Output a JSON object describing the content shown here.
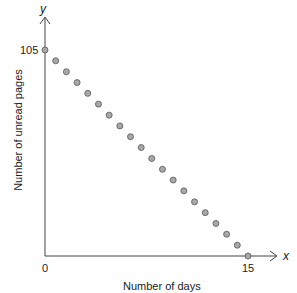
{
  "chart_data": {
    "type": "scatter",
    "title": "",
    "xlabel": "Number of days",
    "ylabel": "Number of unread pages",
    "x_axis_symbol": "x",
    "y_axis_symbol": "y",
    "xticks": [
      "0",
      "15"
    ],
    "yticks": [
      "105"
    ],
    "xlim": [
      0,
      15
    ],
    "ylim": [
      0,
      105
    ],
    "grid": false,
    "points": [
      {
        "x": 0.0,
        "y": 105.0
      },
      {
        "x": 0.79,
        "y": 99.5
      },
      {
        "x": 1.58,
        "y": 93.9
      },
      {
        "x": 2.37,
        "y": 88.4
      },
      {
        "x": 3.16,
        "y": 82.9
      },
      {
        "x": 3.95,
        "y": 77.4
      },
      {
        "x": 4.74,
        "y": 71.8
      },
      {
        "x": 5.53,
        "y": 66.3
      },
      {
        "x": 6.32,
        "y": 60.8
      },
      {
        "x": 7.11,
        "y": 55.3
      },
      {
        "x": 7.89,
        "y": 49.7
      },
      {
        "x": 8.68,
        "y": 44.2
      },
      {
        "x": 9.47,
        "y": 38.7
      },
      {
        "x": 10.26,
        "y": 33.2
      },
      {
        "x": 11.05,
        "y": 27.6
      },
      {
        "x": 11.84,
        "y": 22.1
      },
      {
        "x": 12.63,
        "y": 16.6
      },
      {
        "x": 13.42,
        "y": 11.1
      },
      {
        "x": 14.21,
        "y": 5.5
      },
      {
        "x": 15.0,
        "y": 0.0
      }
    ],
    "point_color": "#a8a8a8"
  }
}
